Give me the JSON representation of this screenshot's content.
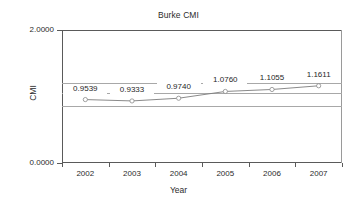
{
  "chart_data": {
    "type": "line",
    "title": "Burke CMI",
    "xlabel": "Year",
    "ylabel": "CMI",
    "categories": [
      "2002",
      "2003",
      "2004",
      "2005",
      "2006",
      "2007"
    ],
    "values": [
      0.9539,
      0.9333,
      0.974,
      1.076,
      1.1055,
      1.1611
    ],
    "point_labels": [
      "0.9539",
      "0.9333",
      "0.9740",
      "1.0760",
      "1.1055",
      "1.1611"
    ],
    "ylim": [
      0.0,
      2.0
    ],
    "ytick_labels": [
      "2.0000",
      "0.0000"
    ],
    "ytick_values": [
      2.0,
      0.0
    ],
    "gridlines": [
      1.2,
      1.05,
      0.85
    ],
    "grid": true,
    "legend": "none",
    "marker": "open-circle",
    "series": [
      {
        "name": "Burke CMI",
        "values": [
          0.9539,
          0.9333,
          0.974,
          1.076,
          1.1055,
          1.1611
        ]
      }
    ],
    "colors": {
      "line": "#7d7d7d",
      "marker": "#8a8a8a",
      "axis": "#5a5a5a",
      "grid": "#a8a8a8",
      "text": "#2b2b2b",
      "background": "#ffffff"
    }
  }
}
